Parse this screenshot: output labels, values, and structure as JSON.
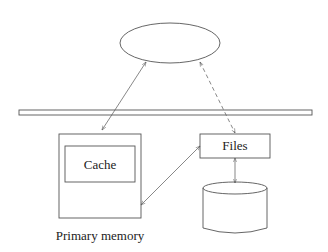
{
  "diagram": {
    "nodes": {
      "client": {
        "label": "",
        "shape": "ellipse"
      },
      "bus": {
        "label": "",
        "shape": "bar"
      },
      "primary_memory": {
        "label": "Primary memory",
        "shape": "rect"
      },
      "cache": {
        "label": "Cache",
        "shape": "rect"
      },
      "files": {
        "label": "Files",
        "shape": "rect"
      },
      "disk": {
        "label": "",
        "shape": "cylinder"
      }
    },
    "edges": [
      {
        "from": "client",
        "to": "primary_memory",
        "style": "solid",
        "direction": "both"
      },
      {
        "from": "client",
        "to": "files",
        "style": "dashed",
        "direction": "both"
      },
      {
        "from": "primary_memory",
        "to": "files",
        "style": "solid",
        "direction": "both"
      },
      {
        "from": "files",
        "to": "disk",
        "style": "solid",
        "direction": "both"
      }
    ],
    "colors": {
      "stroke": "#555555",
      "background": "#ffffff"
    }
  }
}
